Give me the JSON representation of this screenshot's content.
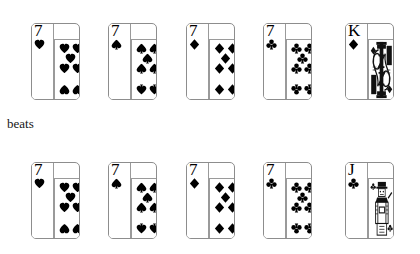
{
  "background": "#ffffff",
  "ink": "#000000",
  "border_color": "#8d8d8d",
  "caption": {
    "text": "beats"
  },
  "suit_glyphs": {
    "hearts": "heart-icon",
    "spades": "spade-icon",
    "diamonds": "diamond-icon",
    "clubs": "club-icon"
  },
  "rows": [
    {
      "name": "top-hand",
      "cards": [
        {
          "rank": "7",
          "suit": "hearts",
          "suit_icon": "heart-icon",
          "type": "pip",
          "label": "seven-of-hearts"
        },
        {
          "rank": "7",
          "suit": "spades",
          "suit_icon": "spade-icon",
          "type": "pip",
          "label": "seven-of-spades"
        },
        {
          "rank": "7",
          "suit": "diamonds",
          "suit_icon": "diamond-icon",
          "type": "pip",
          "label": "seven-of-diamonds"
        },
        {
          "rank": "7",
          "suit": "clubs",
          "suit_icon": "club-icon",
          "type": "pip",
          "label": "seven-of-clubs"
        },
        {
          "rank": "K",
          "suit": "diamonds",
          "suit_icon": "diamond-icon",
          "type": "court",
          "label": "king-of-diamonds"
        }
      ]
    },
    {
      "name": "bottom-hand",
      "cards": [
        {
          "rank": "7",
          "suit": "hearts",
          "suit_icon": "heart-icon",
          "type": "pip",
          "label": "seven-of-hearts"
        },
        {
          "rank": "7",
          "suit": "spades",
          "suit_icon": "spade-icon",
          "type": "pip",
          "label": "seven-of-spades"
        },
        {
          "rank": "7",
          "suit": "diamonds",
          "suit_icon": "diamond-icon",
          "type": "pip",
          "label": "seven-of-diamonds"
        },
        {
          "rank": "7",
          "suit": "clubs",
          "suit_icon": "club-icon",
          "type": "pip",
          "label": "seven-of-clubs"
        },
        {
          "rank": "J",
          "suit": "clubs",
          "suit_icon": "club-icon",
          "type": "court",
          "label": "jack-of-clubs"
        }
      ]
    }
  ],
  "layout": {
    "card_x": [
      31,
      108,
      186,
      263,
      345
    ],
    "card_width": 49,
    "card_height": 77,
    "row_top_y": 23,
    "row_bottom_y": 162,
    "pip_count": 7,
    "pip_positions": [
      {
        "x": 4,
        "y": 3,
        "flip": false
      },
      {
        "x": 17,
        "y": 3,
        "flip": false
      },
      {
        "x": 10,
        "y": 13,
        "flip": false
      },
      {
        "x": 4,
        "y": 23,
        "flip": false
      },
      {
        "x": 17,
        "y": 23,
        "flip": false
      },
      {
        "x": 4,
        "y": 44,
        "flip": true
      },
      {
        "x": 17,
        "y": 44,
        "flip": true
      }
    ]
  }
}
